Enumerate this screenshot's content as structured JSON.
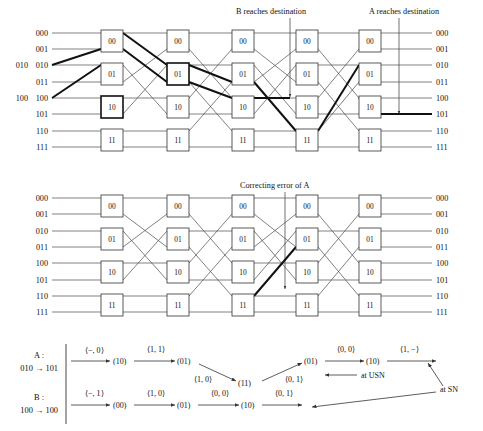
{
  "diagram": {
    "title_implicit": "Butterfly network routing with error correction",
    "row_labels": [
      "000",
      "001",
      "010",
      "011",
      "100",
      "101",
      "110",
      "111"
    ],
    "switch_labels": [
      "00",
      "01",
      "10",
      "11"
    ],
    "stage_count": 5,
    "terminal_markers": {
      "A": "A",
      "B": "B"
    },
    "annotations": {
      "b_reaches": "B reaches destination",
      "a_reaches": "A reaches destination",
      "correcting": "Correcting error of A"
    },
    "colors": {
      "wire": "#4a4a4a",
      "wire_bold": "#111111",
      "box_stroke": "#333333",
      "background": "#ffffff",
      "text": "#111111"
    }
  },
  "top_panel": {
    "left_labels": [
      "000",
      "001",
      "010",
      "011",
      "100",
      "101",
      "110",
      "111"
    ],
    "right_labels": [
      "000",
      "001",
      "010",
      "011",
      "100",
      "101",
      "110",
      "111"
    ],
    "marker_a_row": "010",
    "marker_b_row": "100"
  },
  "middle_panel": {
    "left_labels": [
      "000",
      "001",
      "010",
      "011",
      "100",
      "101",
      "110",
      "111"
    ],
    "right_labels": [
      "000",
      "001",
      "010",
      "011",
      "100",
      "101",
      "110",
      "111"
    ]
  },
  "sequence_panel": {
    "rows": [
      {
        "name": "A :",
        "route": "010 → 101",
        "steps": [
          {
            "edge": "⟨−, 0⟩",
            "node": "(10)"
          },
          {
            "edge": "⟨1, 1⟩",
            "node": "(01)"
          },
          {
            "edge": "⟨1, 0⟩",
            "node": "(11)"
          },
          {
            "edge": "⟨0, 1⟩",
            "node": "(01)"
          },
          {
            "edge": "⟨0, 0⟩",
            "node": "(10)"
          },
          {
            "edge": "⟨1, −⟩",
            "node": ""
          }
        ]
      },
      {
        "name": "B :",
        "route": "100 → 100",
        "steps": [
          {
            "edge": "⟨−, 1⟩",
            "node": "(00)"
          },
          {
            "edge": "⟨1, 0⟩",
            "node": "(01)"
          },
          {
            "edge": "⟨0, 0⟩",
            "node": "(10)"
          },
          {
            "edge": "⟨0, 1⟩",
            "node": ""
          }
        ]
      }
    ],
    "callouts": {
      "usn": "at USN",
      "sn": "at SN"
    }
  }
}
